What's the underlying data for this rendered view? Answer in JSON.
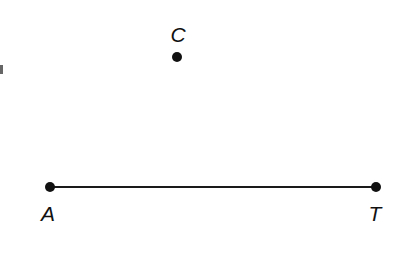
{
  "diagram": {
    "type": "geometry",
    "colors": {
      "stroke": "#1a1a1a",
      "point": "#111111",
      "background": "#ffffff"
    },
    "points": [
      {
        "id": "A",
        "label": "A",
        "x": 50,
        "y": 187,
        "label_x": 48,
        "label_y": 221
      },
      {
        "id": "T",
        "label": "T",
        "x": 376,
        "y": 187,
        "label_x": 375,
        "label_y": 221
      },
      {
        "id": "C",
        "label": "C",
        "x": 177,
        "y": 57,
        "label_x": 178,
        "label_y": 42
      }
    ],
    "segments": [
      {
        "from": "A",
        "to": "T"
      }
    ],
    "clipped_edge_mark": {
      "x": 0,
      "y": 64
    }
  }
}
